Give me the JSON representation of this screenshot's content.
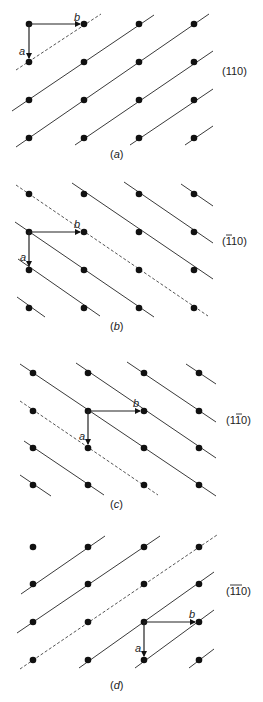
{
  "figure": {
    "grid": {
      "rows": 4,
      "cols": 4,
      "spacing_x": 55,
      "spacing_y": 38
    },
    "panels": [
      {
        "id": "a",
        "caption": "(a)",
        "miller_index": "(110)",
        "miller_parts": [
          {
            "digit": "1",
            "bar": false
          },
          {
            "digit": "1",
            "bar": false
          },
          {
            "digit": "0",
            "bar": false
          }
        ],
        "plane_orientation": "rising",
        "vector_a_label": "a",
        "vector_b_label": "b"
      },
      {
        "id": "b",
        "caption": "(b)",
        "miller_index": "(1̄10)",
        "miller_parts": [
          {
            "digit": "1",
            "bar": true
          },
          {
            "digit": "1",
            "bar": false
          },
          {
            "digit": "0",
            "bar": false
          }
        ],
        "plane_orientation": "falling",
        "vector_a_label": "a",
        "vector_b_label": "b"
      },
      {
        "id": "c",
        "caption": "(c)",
        "miller_index": "(11̄0)",
        "miller_parts": [
          {
            "digit": "1",
            "bar": false
          },
          {
            "digit": "1",
            "bar": true
          },
          {
            "digit": "0",
            "bar": false
          }
        ],
        "plane_orientation": "falling",
        "vector_a_label": "a",
        "vector_b_label": "b"
      },
      {
        "id": "d",
        "caption": "(d)",
        "miller_index": "(1̄1̄0)",
        "miller_parts": [
          {
            "digit": "1",
            "bar": true
          },
          {
            "digit": "1",
            "bar": true
          },
          {
            "digit": "0",
            "bar": false
          }
        ],
        "plane_orientation": "rising",
        "vector_a_label": "a",
        "vector_b_label": "b"
      }
    ]
  }
}
